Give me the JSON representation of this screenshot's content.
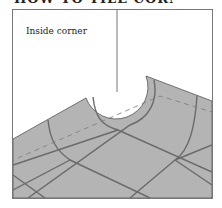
{
  "heading": {
    "text": "HOW TO TILE CORNERS",
    "clipped": true
  },
  "diagram": {
    "label": "Inside corner",
    "colors": {
      "tile": "#b4b4b4",
      "grout": "#6a6a6a",
      "frame": "#777777",
      "background": "#ffffff"
    }
  }
}
